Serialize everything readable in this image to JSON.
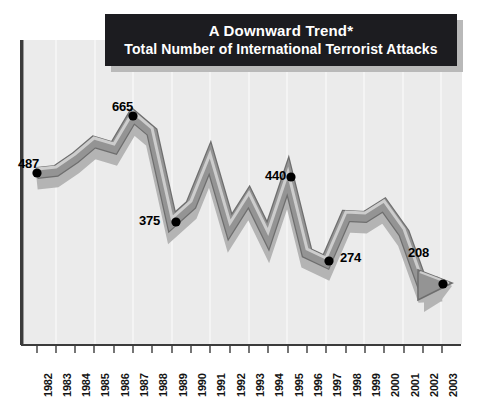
{
  "banner": {
    "line1": "A Downward Trend*",
    "line2": "Total Number of International Terrorist Attacks"
  },
  "colors": {
    "banner_bg": "#1c1c20",
    "banner_text": "#ffffff",
    "banner_shadow": "#b9b9b9",
    "plot_bg": "#ebebeb",
    "gridline": "#fafafa",
    "axis": "#3b3b3b",
    "ribbon_fill": "#8f8f8f",
    "ribbon_highlight": "#c9c9c9",
    "ribbon_outline": "#6e6e6e",
    "marker": "#000000",
    "label_text": "#141414"
  },
  "chart_data": {
    "type": "line",
    "title": "A Downward Trend*",
    "subtitle": "Total Number of International Terrorist Attacks",
    "xlabel": "",
    "ylabel": "",
    "grid": "vertical",
    "legend": "none",
    "xlim": [
      1982,
      2003
    ],
    "ylim": [
      0,
      700
    ],
    "categories": [
      "1982",
      "1983",
      "1984",
      "1985",
      "1986",
      "1987",
      "1988",
      "1989",
      "1990",
      "1991",
      "1992",
      "1993",
      "1994",
      "1995",
      "1996",
      "1997",
      "1998",
      "1999",
      "2000",
      "2001",
      "2002",
      "2003"
    ],
    "values": [
      487,
      497,
      565,
      635,
      612,
      665,
      605,
      375,
      437,
      565,
      363,
      431,
      322,
      440,
      296,
      274,
      395,
      392,
      426,
      355,
      205,
      208
    ],
    "labeled_points": [
      {
        "year": "1982",
        "value": 487,
        "label": "487"
      },
      {
        "year": "1987",
        "value": 665,
        "label": "665"
      },
      {
        "year": "1989",
        "value": 375,
        "label": "375"
      },
      {
        "year": "1995",
        "value": 440,
        "label": "440"
      },
      {
        "year": "1997",
        "value": 274,
        "label": "274"
      },
      {
        "year": "2003",
        "value": 208,
        "label": "208"
      }
    ],
    "annotations": [
      {
        "type": "arrowhead",
        "at": "2003",
        "direction": "down-right"
      }
    ]
  },
  "xaxis": {
    "ticks": [
      {
        "label": "1982",
        "x": 37
      },
      {
        "label": "1983",
        "x": 56
      },
      {
        "label": "1984",
        "x": 75
      },
      {
        "label": "1985",
        "x": 94
      },
      {
        "label": "1986",
        "x": 114
      },
      {
        "label": "1987",
        "x": 133
      },
      {
        "label": "1988",
        "x": 152
      },
      {
        "label": "1989",
        "x": 172
      },
      {
        "label": "1990",
        "x": 191
      },
      {
        "label": "1991",
        "x": 210
      },
      {
        "label": "1992",
        "x": 230
      },
      {
        "label": "1993",
        "x": 249
      },
      {
        "label": "1994",
        "x": 268
      },
      {
        "label": "1995",
        "x": 288
      },
      {
        "label": "1996",
        "x": 307
      },
      {
        "label": "1997",
        "x": 326
      },
      {
        "label": "1998",
        "x": 346
      },
      {
        "label": "1999",
        "x": 365
      },
      {
        "label": "2000",
        "x": 384
      },
      {
        "label": "2001",
        "x": 404
      },
      {
        "label": "2002",
        "x": 423
      },
      {
        "label": "2003",
        "x": 442
      }
    ]
  },
  "point_labels": [
    {
      "text": "487",
      "x": 18,
      "y": 156
    },
    {
      "text": "665",
      "x": 112,
      "y": 99
    },
    {
      "text": "375",
      "x": 139,
      "y": 213
    },
    {
      "text": "440",
      "x": 265,
      "y": 168
    },
    {
      "text": "274",
      "x": 340,
      "y": 250
    },
    {
      "text": "208",
      "x": 408,
      "y": 245
    }
  ]
}
